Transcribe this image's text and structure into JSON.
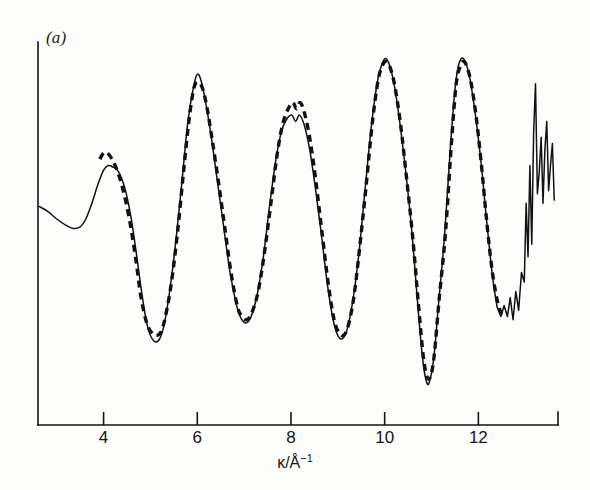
{
  "figure": {
    "panel_label": "(a)",
    "background_color": "#fdfdfc",
    "ink_color": "#111111"
  },
  "axis": {
    "x_title_symbol": "κ",
    "x_title_unit": "/Å",
    "x_title_exponent": "−1",
    "x_title_full": "κ/Å−1",
    "tick_labels": [
      "4",
      "6",
      "8",
      "10",
      "12"
    ],
    "tick_values": [
      4,
      6,
      8,
      10,
      12
    ],
    "y_ticks_shown": "none"
  },
  "chart_data": {
    "type": "line",
    "title": "(a)",
    "xlabel": "κ/Å⁻¹",
    "ylabel": "",
    "xlim": [
      2.6,
      13.7
    ],
    "ylim": [
      -1.15,
      1.15
    ],
    "grid": false,
    "legend": "none",
    "annotations": [
      "solid line = experimental EXAFS",
      "dashed line = fitted / calculated EXAFS"
    ],
    "series": [
      {
        "name": "experimental",
        "style": "solid",
        "color": "#111111",
        "x": [
          2.62,
          2.8,
          3.0,
          3.2,
          3.35,
          3.5,
          3.62,
          3.75,
          3.88,
          4.0,
          4.1,
          4.2,
          4.32,
          4.45,
          4.58,
          4.7,
          4.82,
          4.92,
          5.0,
          5.1,
          5.2,
          5.3,
          5.42,
          5.55,
          5.68,
          5.8,
          5.92,
          6.0,
          6.08,
          6.18,
          6.3,
          6.42,
          6.55,
          6.7,
          6.85,
          6.95,
          7.05,
          7.15,
          7.28,
          7.42,
          7.55,
          7.68,
          7.8,
          7.92,
          8.02,
          8.1,
          8.18,
          8.28,
          8.4,
          8.52,
          8.65,
          8.78,
          8.9,
          9.0,
          9.1,
          9.2,
          9.32,
          9.45,
          9.58,
          9.72,
          9.85,
          9.95,
          10.02,
          10.1,
          10.2,
          10.32,
          10.45,
          10.58,
          10.7,
          10.8,
          10.88,
          10.95,
          11.05,
          11.15,
          11.28,
          11.4,
          11.5,
          11.58,
          11.68,
          11.8,
          11.92,
          12.05,
          12.18,
          12.3,
          12.4,
          12.48,
          12.55,
          12.62,
          12.68,
          12.74,
          12.8,
          12.86,
          12.92,
          12.98,
          13.02,
          13.06,
          13.1,
          13.14,
          13.18,
          13.22,
          13.26,
          13.3,
          13.34,
          13.38,
          13.42,
          13.46,
          13.5,
          13.54,
          13.58,
          13.62
        ],
        "y": [
          0.08,
          0.05,
          0.0,
          -0.04,
          -0.06,
          -0.05,
          0.0,
          0.1,
          0.22,
          0.31,
          0.34,
          0.33,
          0.3,
          0.2,
          0.02,
          -0.22,
          -0.48,
          -0.66,
          -0.74,
          -0.78,
          -0.76,
          -0.66,
          -0.44,
          -0.12,
          0.26,
          0.62,
          0.84,
          0.92,
          0.88,
          0.74,
          0.52,
          0.26,
          -0.02,
          -0.34,
          -0.56,
          -0.64,
          -0.66,
          -0.62,
          -0.48,
          -0.22,
          0.1,
          0.38,
          0.56,
          0.64,
          0.66,
          0.62,
          0.66,
          0.6,
          0.44,
          0.2,
          -0.1,
          -0.42,
          -0.64,
          -0.74,
          -0.76,
          -0.7,
          -0.52,
          -0.22,
          0.18,
          0.6,
          0.88,
          0.99,
          1.02,
          0.98,
          0.86,
          0.62,
          0.3,
          -0.08,
          -0.52,
          -0.86,
          -1.02,
          -1.04,
          -0.88,
          -0.54,
          -0.1,
          0.44,
          0.82,
          0.98,
          1.02,
          0.92,
          0.7,
          0.38,
          -0.02,
          -0.36,
          -0.56,
          -0.62,
          -0.55,
          -0.62,
          -0.5,
          -0.64,
          -0.46,
          -0.58,
          -0.34,
          -0.4,
          0.1,
          -0.24,
          0.34,
          -0.16,
          0.55,
          0.86,
          0.16,
          0.3,
          0.52,
          0.1,
          0.44,
          0.62,
          0.18,
          0.34,
          0.48,
          0.12
        ]
      },
      {
        "name": "calculated",
        "style": "dashed",
        "color": "#111111",
        "x_start": 3.92,
        "x_end": 12.55,
        "x": [
          3.92,
          4.0,
          4.08,
          4.18,
          4.3,
          4.42,
          4.55,
          4.68,
          4.8,
          4.92,
          5.02,
          5.12,
          5.22,
          5.32,
          5.45,
          5.58,
          5.7,
          5.82,
          5.92,
          6.0,
          6.1,
          6.2,
          6.32,
          6.45,
          6.58,
          6.72,
          6.86,
          6.96,
          7.06,
          7.16,
          7.3,
          7.44,
          7.58,
          7.7,
          7.82,
          7.94,
          8.04,
          8.12,
          8.2,
          8.3,
          8.42,
          8.54,
          8.66,
          8.8,
          8.92,
          9.02,
          9.12,
          9.22,
          9.34,
          9.46,
          9.6,
          9.74,
          9.86,
          9.96,
          10.04,
          10.12,
          10.22,
          10.34,
          10.46,
          10.6,
          10.72,
          10.82,
          10.9,
          10.98,
          11.06,
          11.16,
          11.3,
          11.42,
          11.52,
          11.6,
          11.7,
          11.82,
          11.94,
          12.06,
          12.18,
          12.3,
          12.42,
          12.5,
          12.55
        ],
        "y": [
          0.38,
          0.42,
          0.42,
          0.38,
          0.3,
          0.18,
          0.0,
          -0.24,
          -0.5,
          -0.66,
          -0.72,
          -0.74,
          -0.72,
          -0.62,
          -0.4,
          -0.08,
          0.28,
          0.62,
          0.82,
          0.87,
          0.84,
          0.72,
          0.5,
          0.24,
          -0.04,
          -0.34,
          -0.56,
          -0.62,
          -0.64,
          -0.6,
          -0.46,
          -0.2,
          0.12,
          0.4,
          0.6,
          0.7,
          0.74,
          0.7,
          0.74,
          0.66,
          0.48,
          0.22,
          -0.08,
          -0.42,
          -0.64,
          -0.72,
          -0.74,
          -0.68,
          -0.5,
          -0.2,
          0.2,
          0.62,
          0.88,
          0.98,
          1.0,
          0.96,
          0.84,
          0.6,
          0.28,
          -0.12,
          -0.54,
          -0.86,
          -1.0,
          -1.0,
          -0.86,
          -0.52,
          -0.08,
          0.46,
          0.84,
          0.96,
          1.0,
          0.9,
          0.68,
          0.36,
          -0.02,
          -0.34,
          -0.54,
          -0.6,
          -0.6
        ]
      }
    ]
  }
}
